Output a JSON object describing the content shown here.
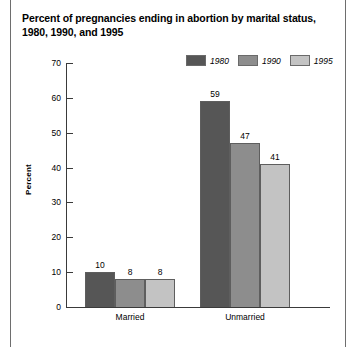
{
  "chart_data": {
    "type": "bar",
    "title": "Percent of pregnancies ending in abortion by marital status, 1980, 1990, and 1995",
    "title_line1": "Percent of pregnancies ending in abortion by marital status,",
    "title_line2": "1980, 1990, and 1995",
    "xlabel": "",
    "ylabel": "Percent",
    "ylim": [
      0,
      70
    ],
    "yticks": [
      0,
      10,
      20,
      30,
      40,
      50,
      60,
      70
    ],
    "ytick_labels": [
      "0",
      "10",
      "20",
      "30",
      "40",
      "50",
      "60",
      "70"
    ],
    "grid": false,
    "legend_position": "top-right",
    "categories": [
      "Married",
      "Unmarried"
    ],
    "series": [
      {
        "name": "1980",
        "color": "#565656",
        "values": [
          10,
          59
        ]
      },
      {
        "name": "1990",
        "color": "#8d8d8d",
        "values": [
          8,
          47
        ]
      },
      {
        "name": "1995",
        "color": "#c3c3c3",
        "values": [
          8,
          41
        ]
      }
    ],
    "value_labels": [
      {
        "group": "Married",
        "series": "1980",
        "text": "10"
      },
      {
        "group": "Married",
        "series": "1990",
        "text": "8"
      },
      {
        "group": "Married",
        "series": "1995",
        "text": "8"
      },
      {
        "group": "Unmarried",
        "series": "1980",
        "text": "59"
      },
      {
        "group": "Unmarried",
        "series": "1990",
        "text": "47"
      },
      {
        "group": "Unmarried",
        "series": "1995",
        "text": "41"
      }
    ]
  },
  "colors": {
    "series_1980": "#565656",
    "series_1990": "#8d8d8d",
    "series_1995": "#c3c3c3",
    "axis": "#3a3a3a",
    "bar_outline": "#5e5e5e",
    "page_rule": "#6e6e6e",
    "background": "#ffffff",
    "text": "#000000"
  }
}
